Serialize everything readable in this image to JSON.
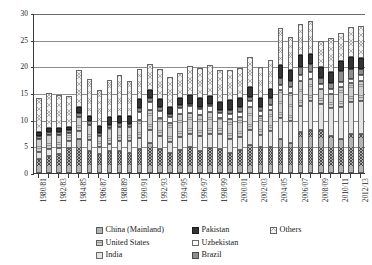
{
  "chart_data": {
    "type": "bar",
    "stacked": true,
    "title": "",
    "subtitle": "",
    "xlabel": "",
    "ylabel": "",
    "ylim": [
      0,
      30
    ],
    "yticks": [
      "0",
      "5",
      "10",
      "15",
      "20",
      "25",
      "30"
    ],
    "grid": true,
    "legend_position": "bottom",
    "categories": [
      "1980/81",
      "1981/82",
      "1982/83",
      "1983/84",
      "1984/85",
      "1985/86",
      "1986/87",
      "1987/88",
      "1988/89",
      "1989/90",
      "1990/91",
      "1991/92",
      "1992/93",
      "1993/94",
      "1994/95",
      "1995/96",
      "1996/97",
      "1997/98",
      "1998/99",
      "1999/00",
      "2000/01",
      "2001/02",
      "2002/03",
      "2003/04",
      "2004/05",
      "2005/06",
      "2006/07",
      "2007/08",
      "2008/09",
      "2009/10",
      "2010/11",
      "2011/12",
      "2012/13"
    ],
    "tick_labels": [
      "1980/81",
      "",
      "1982/83",
      "",
      "1984/85",
      "",
      "1986/87",
      "",
      "1988/89",
      "",
      "1990/91",
      "",
      "1992/93",
      "",
      "1994/95",
      "",
      "1996/97",
      "",
      "1998/99",
      "",
      "2000/01",
      "",
      "2002/03",
      "",
      "2004/05",
      "",
      "2006/07",
      "",
      "2008/09",
      "",
      "2010/11",
      "",
      "2012/13"
    ],
    "series": [
      {
        "name": "China (Mainland)",
        "pattern": "p-china",
        "values": [
          2.7,
          3.2,
          3.5,
          4.6,
          6.3,
          4.2,
          3.5,
          4.2,
          4.2,
          3.8,
          4.5,
          5.7,
          4.5,
          3.7,
          4.3,
          4.8,
          4.2,
          4.6,
          4.5,
          3.8,
          4.4,
          5.3,
          4.9,
          4.9,
          6.3,
          5.7,
          7.7,
          8.1,
          8.0,
          6.9,
          6.4,
          7.4,
          7.3
        ]
      },
      {
        "name": "India",
        "pattern": "p-india",
        "values": [
          1.3,
          1.3,
          1.2,
          1.4,
          1.6,
          2.0,
          1.4,
          1.2,
          1.8,
          2.2,
          2.0,
          2.4,
          2.4,
          2.1,
          2.4,
          2.6,
          2.7,
          2.7,
          2.8,
          2.6,
          2.4,
          2.7,
          2.3,
          3.0,
          4.1,
          4.1,
          4.8,
          5.4,
          4.9,
          5.2,
          5.9,
          6.0,
          6.2
        ]
      },
      {
        "name": "United States",
        "pattern": "p-us",
        "values": [
          2.4,
          2.6,
          2.4,
          1.5,
          2.6,
          2.9,
          2.1,
          3.1,
          2.6,
          2.6,
          3.4,
          3.7,
          3.5,
          3.5,
          4.3,
          3.9,
          4.1,
          4.1,
          3.0,
          3.7,
          3.7,
          4.4,
          3.4,
          3.9,
          5.1,
          5.2,
          4.7,
          4.2,
          2.8,
          2.7,
          3.9,
          3.4,
          3.8
        ]
      },
      {
        "name": "Uzbekistan",
        "pattern": "p-uzbek",
        "values": [
          0.0,
          0.0,
          0.0,
          0.0,
          0.0,
          0.0,
          0.0,
          0.0,
          0.0,
          0.0,
          1.6,
          1.5,
          1.3,
          1.3,
          1.2,
          1.2,
          1.1,
          1.1,
          1.0,
          1.0,
          0.9,
          1.1,
          1.0,
          0.9,
          1.1,
          1.2,
          1.2,
          1.2,
          1.0,
          0.9,
          0.9,
          0.9,
          1.0
        ]
      },
      {
        "name": "Brazil",
        "pattern": "p-brazil",
        "values": [
          0.6,
          0.6,
          0.6,
          0.6,
          0.8,
          0.7,
          0.6,
          0.6,
          0.7,
          0.6,
          0.7,
          0.7,
          0.6,
          0.5,
          0.5,
          0.4,
          0.3,
          0.4,
          0.5,
          0.7,
          0.9,
          0.8,
          0.8,
          1.3,
          1.3,
          1.0,
          1.5,
          1.6,
          1.2,
          1.2,
          2.0,
          1.9,
          1.3
        ]
      },
      {
        "name": "Pakistan",
        "pattern": "p-pakistan",
        "values": [
          0.7,
          0.7,
          0.8,
          0.5,
          1.0,
          0.9,
          1.3,
          1.5,
          1.4,
          1.5,
          1.6,
          1.5,
          1.5,
          1.3,
          1.4,
          1.7,
          1.6,
          1.6,
          1.5,
          1.9,
          1.8,
          1.8,
          1.7,
          1.7,
          2.4,
          2.2,
          2.2,
          1.9,
          1.9,
          2.1,
          1.9,
          2.1,
          2.0
        ]
      },
      {
        "name": "Others",
        "pattern": "p-others",
        "values": [
          6.4,
          6.7,
          6.2,
          5.9,
          7.1,
          6.9,
          6.7,
          6.9,
          7.7,
          6.6,
          5.7,
          5.0,
          5.8,
          5.6,
          4.7,
          5.4,
          5.6,
          5.7,
          6.1,
          5.6,
          5.6,
          5.7,
          5.7,
          5.5,
          6.9,
          6.2,
          5.9,
          6.2,
          4.9,
          6.4,
          5.2,
          5.6,
          5.9
        ]
      }
    ]
  },
  "legend": {
    "entries": [
      {
        "label": "China (Mainland)",
        "pattern": "p-china"
      },
      {
        "label": "Pakistan",
        "pattern": "p-pakistan"
      },
      {
        "label": "Others",
        "pattern": "p-others"
      },
      {
        "label": "United States",
        "pattern": "p-us"
      },
      {
        "label": "Uzbekistan",
        "pattern": "p-uzbek"
      },
      {
        "label": "",
        "pattern": ""
      },
      {
        "label": "India",
        "pattern": "p-india"
      },
      {
        "label": "Brazil",
        "pattern": "p-brazil"
      },
      {
        "label": "",
        "pattern": ""
      }
    ]
  }
}
